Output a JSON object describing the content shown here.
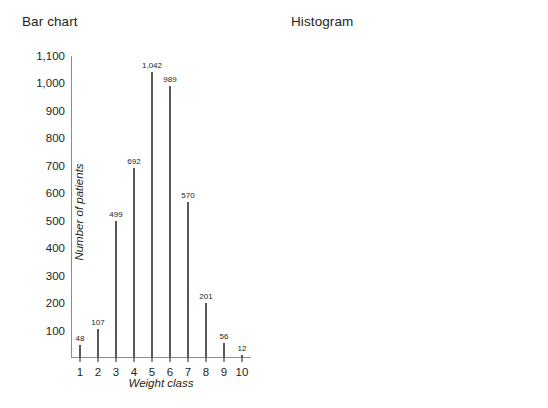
{
  "panels": [
    {
      "title": "Bar chart"
    },
    {
      "title": "Histogram"
    }
  ],
  "axis": {
    "ylabel": "Number of patients",
    "xlabel": "Weight class",
    "yticks": [
      "100",
      "200",
      "300",
      "400",
      "500",
      "600",
      "700",
      "800",
      "900",
      "1,000",
      "1,100"
    ],
    "xticks": [
      "1",
      "2",
      "3",
      "4",
      "5",
      "6",
      "7",
      "8",
      "9",
      "10"
    ]
  },
  "value_labels": [
    "48",
    "107",
    "499",
    "692",
    "1,042",
    "989",
    "570",
    "201",
    "56",
    "12"
  ],
  "colors": {
    "spike": "#595959",
    "bar": "#b8b8b8",
    "axis": "#8d8d8d",
    "text": "#231f20",
    "background": "#ffffff"
  },
  "chart_data": [
    {
      "type": "bar",
      "title": "Bar chart",
      "xlabel": "Weight class",
      "ylabel": "Number of patients",
      "categories": [
        "1",
        "2",
        "3",
        "4",
        "5",
        "6",
        "7",
        "8",
        "9",
        "10"
      ],
      "values": [
        48,
        107,
        499,
        692,
        1042,
        989,
        570,
        201,
        56,
        12
      ],
      "data_labels": [
        "48",
        "107",
        "499",
        "692",
        "1,042",
        "989",
        "570",
        "201",
        "56",
        "12"
      ],
      "ylim": [
        0,
        1100
      ],
      "ytick_values": [
        100,
        200,
        300,
        400,
        500,
        600,
        700,
        800,
        900,
        1000,
        1100
      ],
      "grid": false,
      "legend": null,
      "style": "thin vertical lines (spikes) with gaps between categories"
    },
    {
      "type": "bar",
      "title": "Histogram",
      "xlabel": "Weight class",
      "ylabel": "Number of patients",
      "categories": [
        "1",
        "2",
        "3",
        "4",
        "5",
        "6",
        "7",
        "8",
        "9",
        "10"
      ],
      "values": [
        48,
        107,
        499,
        692,
        1042,
        989,
        570,
        201,
        56,
        12
      ],
      "data_labels": [
        "48",
        "107",
        "499",
        "692",
        "1,042",
        "989",
        "570",
        "201",
        "56",
        "12"
      ],
      "ylim": [
        0,
        1100
      ],
      "ytick_values": [
        100,
        200,
        300,
        400,
        500,
        600,
        700,
        800,
        900,
        1000,
        1100
      ],
      "grid": false,
      "legend": null,
      "style": "filled gray bars, adjacent with small gaps"
    }
  ]
}
